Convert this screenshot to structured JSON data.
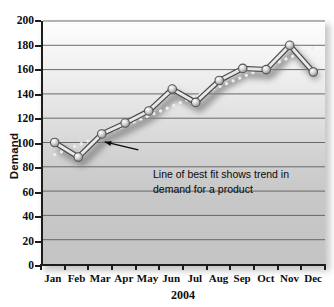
{
  "chart_data": {
    "type": "line",
    "title": "",
    "xlabel": "2004",
    "ylabel": "Demand",
    "categories": [
      "Jan",
      "Feb",
      "Mar",
      "Apr",
      "May",
      "Jun",
      "Jul",
      "Aug",
      "Sep",
      "Oct",
      "Nov",
      "Dec"
    ],
    "ylim": [
      0,
      200
    ],
    "ytick_step": 20,
    "yticks": [
      0,
      20,
      40,
      60,
      80,
      100,
      120,
      140,
      160,
      180,
      200
    ],
    "grid": true,
    "legend": "none",
    "series": [
      {
        "name": "Demand",
        "style": "line-with-round-markers",
        "values": [
          100,
          88,
          107,
          116,
          126,
          144,
          133,
          151,
          161,
          160,
          180,
          158
        ]
      },
      {
        "name": "Line of best fit",
        "style": "dotted-trend",
        "values": [
          90,
          98,
          106,
          114,
          122,
          130,
          138,
          146,
          154,
          162,
          170,
          178
        ]
      }
    ],
    "annotations": [
      {
        "line1": "Line of best fit shows trend in",
        "line2": "demand for a product",
        "points_to": "Mar"
      }
    ]
  },
  "colors": {
    "axis": "#1d1d1d",
    "gridline": "#5a5a5a",
    "series_line": "#e8e8e8",
    "series_line_edge": "#4a4a4a",
    "marker_fill": "#c9c9c9",
    "trend_dot": "#ededed",
    "text": "#0d0d0d",
    "plot_bg_top": "#fdfdfd",
    "plot_bg_bottom": "#c4c4c4"
  }
}
